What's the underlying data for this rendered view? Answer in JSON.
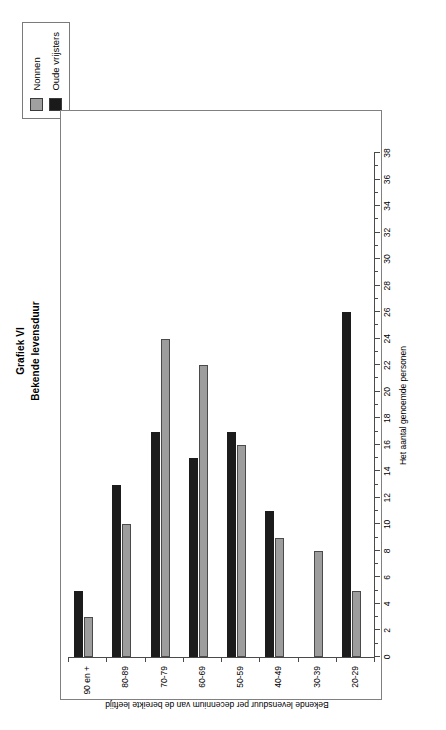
{
  "chart_data": {
    "type": "bar",
    "orientation": "horizontal-rotated",
    "title": "Grafiek VI",
    "subtitle": "Bekende levensduur",
    "xlabel": "Bekende levensduur per decennium van de bereikte leeftijd",
    "ylabel": "Het aantal genoemde personen",
    "categories": [
      "20-29",
      "30-39",
      "40-49",
      "50-59",
      "60-69",
      "70-79",
      "80-89",
      "90 en +"
    ],
    "series": [
      {
        "name": "Nonnen",
        "color": "#9d9d9d",
        "values": [
          5,
          8,
          9,
          16,
          22,
          24,
          10,
          3
        ]
      },
      {
        "name": "Oude vrijsters",
        "color": "#1c1c1c",
        "values": [
          26,
          0,
          11,
          17,
          15,
          17,
          13,
          5
        ]
      }
    ],
    "ylim": [
      0,
      38
    ],
    "ytick_step": 2,
    "yticks": [
      0,
      2,
      4,
      6,
      8,
      10,
      12,
      14,
      16,
      18,
      20,
      22,
      24,
      26,
      28,
      30,
      32,
      34,
      36,
      38
    ],
    "minor_tick_step": 1,
    "grid": false,
    "legend_position": "top-right",
    "legend_entries": [
      "Nonnen",
      "Oude vrijsters"
    ]
  },
  "figure": {
    "title_main": "Grafiek VI",
    "title_sub": "Bekende levensduur"
  },
  "legend": {
    "items": [
      {
        "label": "Nonnen",
        "color": "#9d9d9d"
      },
      {
        "label": "Oude vrijsters",
        "color": "#1c1c1c"
      }
    ]
  },
  "axes": {
    "value_axis_title": "Het aantal genoemde personen",
    "category_axis_title": "Bekende levensduur per decennium van de bereikte leeftijd"
  }
}
